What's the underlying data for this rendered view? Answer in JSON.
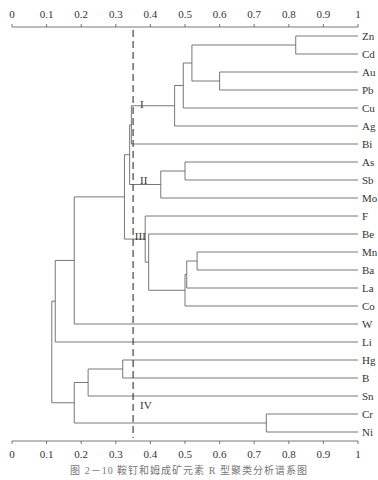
{
  "chart_data": {
    "type": "dendrogram",
    "title": "",
    "caption": "图 2－10 鞍钉和姆成矿元素 R 型聚类分析谱系图",
    "axis": {
      "min": 0,
      "max": 1,
      "ticks": [
        "0",
        "0.1",
        "0.2",
        "0.3",
        "0.4",
        "0.5",
        "0.6",
        "0.7",
        "0.8",
        "0.9",
        "1"
      ],
      "top_and_bottom": true
    },
    "leaves": [
      "Zn",
      "Cd",
      "Au",
      "Pb",
      "Cu",
      "Ag",
      "Bi",
      "As",
      "Sb",
      "Mo",
      "F",
      "Be",
      "Mn",
      "Ba",
      "La",
      "Co",
      "W",
      "Li",
      "Hg",
      "B",
      "Sn",
      "Cr",
      "Ni"
    ],
    "cut_line": {
      "value": 0.35,
      "style": "dashed"
    },
    "cluster_labels": [
      {
        "label": "I",
        "x": 0.37,
        "row": 3.8
      },
      {
        "label": "II",
        "x": 0.37,
        "row": 8.0
      },
      {
        "label": "III",
        "x": 0.355,
        "row": 11.1
      },
      {
        "label": "IV",
        "x": 0.37,
        "row": 20.5
      }
    ],
    "merges": [
      {
        "id": "n1",
        "a": "Zn",
        "b": "Cd",
        "height": 0.82
      },
      {
        "id": "n2",
        "a": "Au",
        "b": "Pb",
        "height": 0.6
      },
      {
        "id": "n3",
        "a": "n1",
        "b": "n2",
        "height": 0.52
      },
      {
        "id": "n4",
        "a": "n3",
        "b": "Cu",
        "height": 0.495
      },
      {
        "id": "n5",
        "a": "n4",
        "b": "Ag",
        "height": 0.47
      },
      {
        "id": "n6",
        "a": "n5",
        "b": "Bi",
        "height": 0.345
      },
      {
        "id": "n7",
        "a": "As",
        "b": "Sb",
        "height": 0.5
      },
      {
        "id": "n8",
        "a": "n7",
        "b": "Mo",
        "height": 0.43
      },
      {
        "id": "n9",
        "a": "n6",
        "b": "n8",
        "height": 0.34
      },
      {
        "id": "n10",
        "a": "Mn",
        "b": "Ba",
        "height": 0.535
      },
      {
        "id": "n11",
        "a": "n10",
        "b": "La",
        "height": 0.505
      },
      {
        "id": "n12",
        "a": "n11",
        "b": "Co",
        "height": 0.5
      },
      {
        "id": "n13",
        "a": "Be",
        "b": "n12",
        "height": 0.395
      },
      {
        "id": "n14",
        "a": "F",
        "b": "n13",
        "height": 0.385
      },
      {
        "id": "n15",
        "a": "n9",
        "b": "n14",
        "height": 0.325
      },
      {
        "id": "n16",
        "a": "n15",
        "b": "W",
        "height": 0.18
      },
      {
        "id": "n17",
        "a": "n16",
        "b": "Li",
        "height": 0.125
      },
      {
        "id": "n18",
        "a": "Hg",
        "b": "B",
        "height": 0.32
      },
      {
        "id": "n19",
        "a": "n18",
        "b": "Sn",
        "height": 0.22
      },
      {
        "id": "n20",
        "a": "Cr",
        "b": "Ni",
        "height": 0.735
      },
      {
        "id": "n21",
        "a": "n19",
        "b": "n20",
        "height": 0.18
      },
      {
        "id": "n22",
        "a": "n17",
        "b": "n21",
        "height": 0.115
      }
    ]
  },
  "layout": {
    "x0": 12,
    "x1": 358,
    "row_top": 36,
    "row_step": 18,
    "axis_top_y": 27,
    "axis_bottom_y": 441,
    "label_x": 362,
    "line_color": "#555555",
    "text_color": "#333333"
  }
}
